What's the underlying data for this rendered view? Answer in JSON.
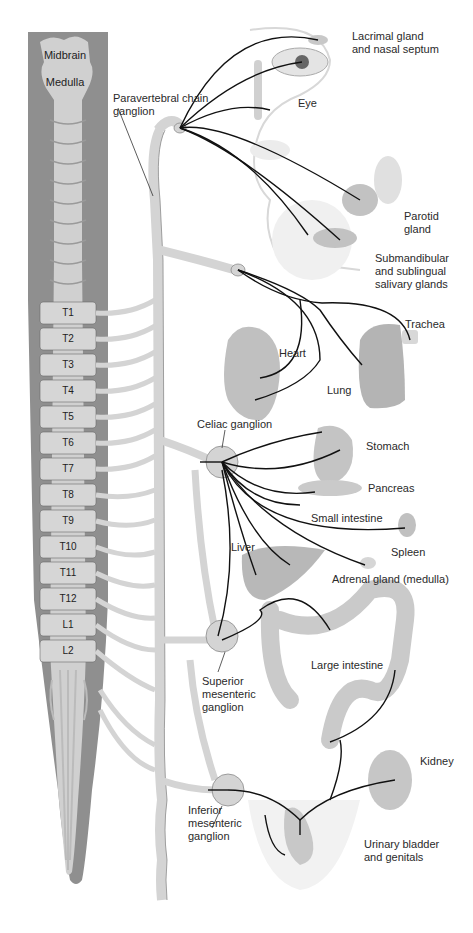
{
  "figure": {
    "colors": {
      "cord_outer": "#8f8f8f",
      "cord_inner": "#cfcfcf",
      "chain": "#d4d4d4",
      "chain_outline": "#8a8a8a",
      "nerve": "#111111",
      "organ": "#b8b8b8",
      "background": "#ffffff"
    }
  },
  "cns": {
    "brain_labels": [
      "Midbrain",
      "Medulla"
    ],
    "segments": [
      "T1",
      "T2",
      "T3",
      "T4",
      "T5",
      "T6",
      "T7",
      "T8",
      "T9",
      "T10",
      "T11",
      "T12",
      "L1",
      "L2"
    ]
  },
  "ganglia": {
    "paravertebral": "Paravertebral chain\nganglion",
    "celiac": "Celiac ganglion",
    "superior_mesenteric": "Superior\nmesenteric\nganglion",
    "inferior_mesenteric": "Inferior\nmesenteric\nganglion"
  },
  "organs": {
    "lacrimal": "Lacrimal gland\nand nasal septum",
    "eye": "Eye",
    "parotid": "Parotid\ngland",
    "submandibular": "Submandibular\nand sublingual\nsalivary glands",
    "trachea": "Trachea",
    "heart": "Heart",
    "lung": "Lung",
    "stomach": "Stomach",
    "pancreas": "Pancreas",
    "small_intestine": "Small intestine",
    "spleen": "Spleen",
    "liver": "Liver",
    "adrenal": "Adrenal gland (medulla)",
    "large_intestine": "Large intestine",
    "kidney": "Kidney",
    "bladder": "Urinary bladder\nand genitals"
  }
}
